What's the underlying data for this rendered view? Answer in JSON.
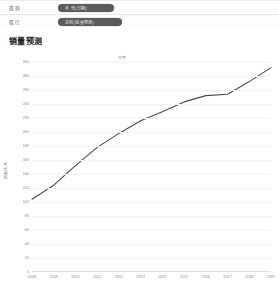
{
  "shelf": {
    "rows": [
      {
        "label": "筛列",
        "pill": "年 份(日期)"
      },
      {
        "label": "筛行",
        "pill": "总和(销量预测)"
      }
    ]
  },
  "chart": {
    "title": "销量预测",
    "legend": "日期"
  },
  "chart_data": {
    "type": "line",
    "title": "销量预测",
    "xlabel": "",
    "ylabel": "销量预测",
    "legend_entries": [
      "日期"
    ],
    "legend_position": "top-center",
    "grid": true,
    "line_color": "#4b4b4b",
    "categories": [
      2008,
      2009,
      2010,
      2011,
      2012,
      2013,
      2014,
      2015,
      2016,
      2017,
      2018,
      2019
    ],
    "x": [
      "2008",
      "2009",
      "2010",
      "2011",
      "2012",
      "2013",
      "2014",
      "2015",
      "2016",
      "2017",
      "2018",
      "2019"
    ],
    "values": [
      104,
      124,
      152,
      178,
      198,
      216,
      229,
      243,
      252,
      254,
      272,
      292
    ],
    "series": [
      {
        "name": "日期",
        "values": [
          104,
          124,
          152,
          178,
          198,
          216,
          229,
          243,
          252,
          254,
          272,
          292
        ]
      }
    ],
    "xlim": [
      2008,
      2019
    ],
    "ylim": [
      0,
      300
    ],
    "yticks": [
      0,
      20,
      40,
      60,
      80,
      100,
      120,
      140,
      160,
      180,
      200,
      220,
      240,
      260,
      280,
      300
    ],
    "ytick_labels": [
      "0",
      "20",
      "40",
      "60",
      "80",
      "100",
      "120",
      "140",
      "160",
      "180",
      "200",
      "220",
      "240",
      "260",
      "280",
      "300"
    ],
    "xtick_labels": [
      "2008",
      "2009",
      "2010",
      "2011",
      "2012",
      "2013",
      "2014",
      "2015",
      "2016",
      "2017",
      "2018",
      "2019"
    ]
  }
}
